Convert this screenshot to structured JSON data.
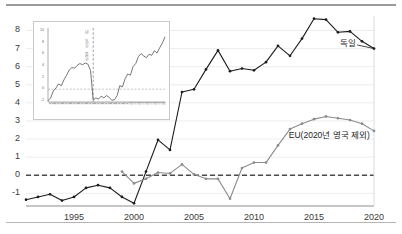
{
  "chart_data": {
    "type": "line",
    "title": "",
    "xlabel": "",
    "ylabel": "",
    "xlim": [
      1991,
      2020
    ],
    "ylim": [
      -1.7,
      8.8
    ],
    "yticks": [
      -1,
      0,
      1,
      2,
      3,
      4,
      5,
      6,
      7,
      8
    ],
    "xticks": [
      1995,
      2000,
      2005,
      2010,
      2015,
      2020
    ],
    "grid": "horizontal",
    "zero_reference_line": 0,
    "legend_position": "inline-annotations",
    "x": [
      1991,
      1992,
      1993,
      1994,
      1995,
      1996,
      1997,
      1998,
      1999,
      2000,
      2001,
      2002,
      2003,
      2004,
      2005,
      2006,
      2007,
      2008,
      2009,
      2010,
      2011,
      2012,
      2013,
      2014,
      2015,
      2016,
      2017,
      2018,
      2019,
      2020
    ],
    "series": [
      {
        "name": "독일",
        "color": "#1c1c1c",
        "markers": true,
        "values": [
          -1.35,
          -1.2,
          -1.05,
          -1.4,
          -1.2,
          -0.7,
          -0.55,
          -0.7,
          -1.2,
          -1.55,
          0.2,
          1.95,
          1.4,
          4.6,
          4.75,
          5.85,
          6.9,
          5.75,
          5.9,
          5.8,
          6.25,
          7.15,
          6.6,
          7.55,
          8.65,
          8.6,
          7.9,
          7.95,
          7.4,
          7.0
        ]
      },
      {
        "name": "EU(2020년 영국 제외)",
        "color": "#8c8c8c",
        "markers": true,
        "values": [
          null,
          null,
          null,
          null,
          null,
          null,
          null,
          null,
          0.2,
          -0.45,
          -0.2,
          0.15,
          0.1,
          0.6,
          0.05,
          -0.2,
          -0.2,
          -1.3,
          0.4,
          0.7,
          0.7,
          1.65,
          2.55,
          2.85,
          3.1,
          3.25,
          3.15,
          3.05,
          2.85,
          2.45
        ]
      }
    ],
    "annotations": [
      {
        "text": "독일",
        "x": 2017.2,
        "y": 7.25
      },
      {
        "text": "EU(2020년 영국 제외)",
        "x": 2012.9,
        "y": 2.15
      }
    ],
    "inset": {
      "type": "line",
      "ylim": [
        -2.2,
        10.5
      ],
      "yticks": [
        -2,
        0,
        2,
        4,
        6,
        8,
        10
      ],
      "grid": "none",
      "zero_reference_line": 0,
      "vertical_marker_label": "년 독일 통일",
      "series_color": "#4a4a4a",
      "values": [
        -2.0,
        -1.5,
        -0.3,
        0.2,
        0.9,
        0.6,
        1.6,
        2.4,
        3.3,
        3.7,
        3.6,
        4.1,
        4.4,
        4.2,
        4.5,
        4.3,
        3.2,
        -1.9,
        -1.5,
        -1.7,
        -1.2,
        -1.5,
        -1.1,
        -1.4,
        -1.9,
        -1.8,
        -1.1,
        0.6,
        0.4,
        1.8,
        2.6,
        2.4,
        3.9,
        4.4,
        5.6,
        6.1,
        5.7,
        5.4,
        6.0,
        5.8,
        6.6,
        6.2,
        7.1,
        7.9,
        9.0
      ],
      "xlabels": [
        "1970",
        "1971",
        "1972",
        "1973",
        "1974",
        "1975",
        "1976",
        "1977",
        "1978",
        "1979",
        "1980",
        "1981",
        "1982",
        "1983",
        "1984",
        "1985",
        "1986",
        "1987",
        "1988",
        "1989",
        "1990",
        "1991",
        "1992",
        "1993",
        "1994",
        "1995",
        "1996",
        "1997",
        "1998",
        "1999",
        "2000",
        "2001",
        "2002",
        "2003",
        "2004",
        "2005",
        "2006",
        "2007",
        "2008",
        "2009",
        "2010",
        "2011",
        "2012",
        "2013",
        "2014"
      ]
    }
  }
}
